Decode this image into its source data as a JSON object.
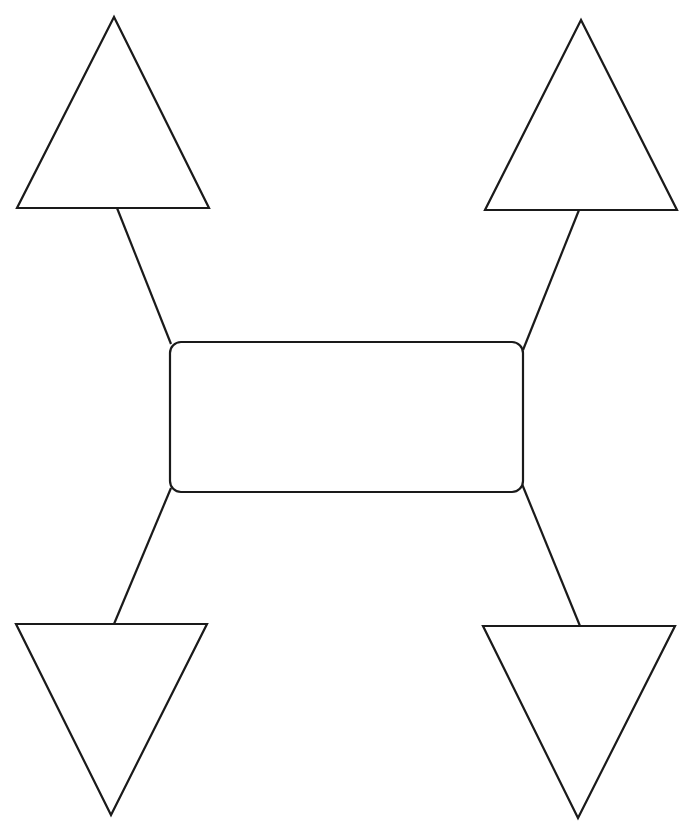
{
  "diagram": {
    "type": "graphic-organizer",
    "center": {
      "label": ""
    },
    "nodes": [
      {
        "id": "top-left",
        "shape": "triangle-up",
        "label": ""
      },
      {
        "id": "top-right",
        "shape": "triangle-up",
        "label": ""
      },
      {
        "id": "bottom-left",
        "shape": "triangle-down",
        "label": ""
      },
      {
        "id": "bottom-right",
        "shape": "triangle-down",
        "label": ""
      }
    ],
    "stroke_color": "#1a1a1a",
    "background_color": "#ffffff"
  }
}
